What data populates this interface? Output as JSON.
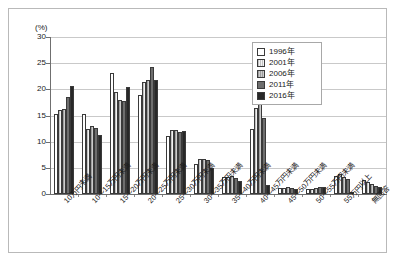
{
  "chart_data": {
    "type": "bar",
    "title": "",
    "xlabel": "",
    "ylabel": "(%)",
    "unit_label": "(%)",
    "ylim": [
      0,
      30
    ],
    "yticks": [
      0,
      5,
      10,
      15,
      20,
      25,
      30
    ],
    "ytick_labels": [
      "0",
      "5",
      "10",
      "15",
      "20",
      "25",
      "30"
    ],
    "grid": true,
    "legend_position": "top-right",
    "categories": [
      "10万円未満",
      "10〜15万円未満",
      "15〜20万円未満",
      "20〜25万円未満",
      "25〜30万円未満",
      "30〜35万円未満",
      "35〜40万円未満",
      "40〜45万円未満",
      "45〜50万円未満",
      "50〜55万円未満",
      "55万円以上",
      "無回答"
    ],
    "series": [
      {
        "name": "1996年",
        "color": "#ffffff",
        "values": [
          15.2,
          15.3,
          23.1,
          18.9,
          11.0,
          5.7,
          3.3,
          12.4,
          1.2,
          1.0,
          3.4,
          2.6
        ]
      },
      {
        "name": "2001年",
        "color": "#ededed",
        "values": [
          16.1,
          12.5,
          19.5,
          21.4,
          12.2,
          6.6,
          3.2,
          16.5,
          1.1,
          1.0,
          3.8,
          2.3
        ]
      },
      {
        "name": "2006年",
        "color": "#c3c3c3",
        "values": [
          16.3,
          13.0,
          18.0,
          21.8,
          12.3,
          6.7,
          3.5,
          17.9,
          1.3,
          1.2,
          3.3,
          1.9
        ]
      },
      {
        "name": "2011年",
        "color": "#6e6e6e",
        "values": [
          18.5,
          12.7,
          17.8,
          24.3,
          11.8,
          6.5,
          3.0,
          14.6,
          1.2,
          1.4,
          2.8,
          1.5
        ]
      },
      {
        "name": "2016年",
        "color": "#282828",
        "values": [
          20.6,
          11.3,
          20.4,
          21.8,
          12.0,
          4.9,
          2.5,
          1.7,
          1.0,
          1.3,
          0.4,
          1.3
        ]
      }
    ]
  },
  "legend": {
    "items": [
      {
        "label": "1996年"
      },
      {
        "label": "2001年"
      },
      {
        "label": "2006年"
      },
      {
        "label": "2011年"
      },
      {
        "label": "2016年"
      }
    ]
  }
}
